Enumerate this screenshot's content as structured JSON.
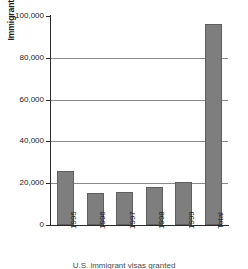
{
  "chart_data": {
    "type": "bar",
    "title": "",
    "xlabel": "",
    "ylabel": "Immigrant visas granted",
    "categories": [
      "1995",
      "1996",
      "1997",
      "1998",
      "1999",
      "Total"
    ],
    "values": [
      26000,
      15500,
      16000,
      18000,
      20500,
      96000
    ],
    "ylim": [
      0,
      100000
    ],
    "ytick_values": [
      0,
      20000,
      40000,
      60000,
      80000,
      100000
    ],
    "ytick_labels": [
      "0",
      "20,000",
      "40,000",
      "60,000",
      "80,000",
      "100,000"
    ],
    "gridlines_at": [
      20000,
      40000,
      60000,
      80000
    ],
    "grid": true,
    "legend": "none",
    "orientation": "vertical",
    "bar_color": "#7e7e7e",
    "bar_edge_color": "#5e5e5e",
    "axis_color": "#2b2b2b",
    "gridline_color": "#8a8a8a",
    "background_color": "#ffffff"
  },
  "figure": {
    "caption": "U.S. immigrant visas granted"
  }
}
